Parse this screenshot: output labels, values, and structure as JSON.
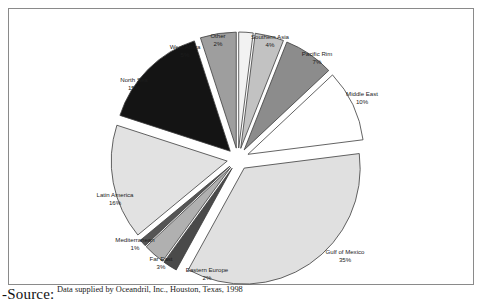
{
  "chart_data": {
    "type": "pie",
    "title": "",
    "subtitle": "",
    "xlabel": "",
    "ylabel": "",
    "legend_position": "none",
    "grid": false,
    "exploded": true,
    "start_angle_deg": -90,
    "direction": "clockwise",
    "units": "percent",
    "categories": [
      "Other",
      "Southern Asia",
      "Pacific Rim",
      "Middle East",
      "Gulf of Mexico",
      "Eastern Europe",
      "Far East",
      "Mediterranean",
      "Latin America",
      "North Sea",
      "West Africa"
    ],
    "values": [
      2,
      4,
      7,
      10,
      35,
      2,
      3,
      1,
      16,
      15,
      5
    ],
    "colors": [
      "#f2f2f2",
      "#c2c2c2",
      "#8c8c8c",
      "#ffffff",
      "#e0e0e0",
      "#4a4a4a",
      "#b0b0b0",
      "#555555",
      "#e2e2e2",
      "#141414",
      "#9e9e9e"
    ],
    "slices": [
      {
        "label": "Other",
        "value": 2,
        "value_text": "2%",
        "color": "#f2f2f2",
        "label_x": 209,
        "label_y": 27
      },
      {
        "label": "Southern Asia",
        "value": 4,
        "value_text": "4%",
        "color": "#c2c2c2",
        "label_x": 261,
        "label_y": 28
      },
      {
        "label": "Pacific Rim",
        "value": 7,
        "value_text": "7%",
        "color": "#8c8c8c",
        "label_x": 308,
        "label_y": 45
      },
      {
        "label": "Middle East",
        "value": 10,
        "value_text": "10%",
        "color": "#ffffff",
        "label_x": 353,
        "label_y": 85
      },
      {
        "label": "Gulf of Mexico",
        "value": 35,
        "value_text": "35%",
        "color": "#e0e0e0",
        "label_x": 336,
        "label_y": 243
      },
      {
        "label": "Eastern Europe",
        "value": 2,
        "value_text": "2%",
        "color": "#4a4a4a",
        "label_x": 198,
        "label_y": 261
      },
      {
        "label": "Far East",
        "value": 3,
        "value_text": "3%",
        "color": "#b0b0b0",
        "label_x": 152,
        "label_y": 250
      },
      {
        "label": "Mediterranean",
        "value": 1,
        "value_text": "1%",
        "color": "#555555",
        "label_x": 126,
        "label_y": 231
      },
      {
        "label": "Latin America",
        "value": 16,
        "value_text": "16%",
        "color": "#e2e2e2",
        "label_x": 106,
        "label_y": 186
      },
      {
        "label": "North Sea",
        "value": 15,
        "value_text": "15%",
        "color": "#141414",
        "label_x": 125,
        "label_y": 71
      },
      {
        "label": "West Africa",
        "value": 5,
        "value_text": "5%",
        "color": "#9e9e9e",
        "label_x": 176,
        "label_y": 38
      }
    ]
  },
  "caption": {
    "source_word": "-Source:",
    "source_text": "Data supplied by Oceandril, Inc., Houston, Texas, 1998"
  }
}
